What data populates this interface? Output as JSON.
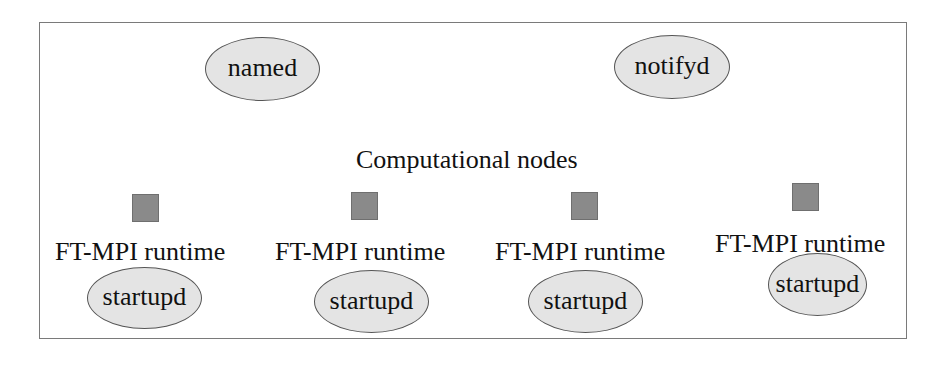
{
  "diagram": {
    "title": "Computational nodes",
    "services": [
      {
        "label": "named"
      },
      {
        "label": "notifyd"
      }
    ],
    "nodes": [
      {
        "runtime_label": "FT-MPI runtime",
        "daemon_label": "startupd"
      },
      {
        "runtime_label": "FT-MPI runtime",
        "daemon_label": "startupd"
      },
      {
        "runtime_label": "FT-MPI runtime",
        "daemon_label": "startupd"
      },
      {
        "runtime_label": "FT-MPI runtime",
        "daemon_label": "startupd"
      }
    ],
    "colors": {
      "frame_border": "#7a7a7a",
      "ellipse_fill": "#e4e4e4",
      "ellipse_border": "#555555",
      "node_square_fill": "#8a8a8a"
    }
  }
}
